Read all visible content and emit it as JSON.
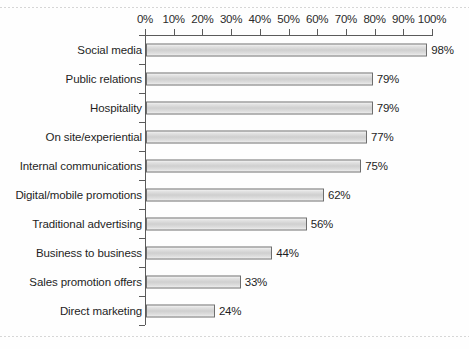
{
  "chart_data": {
    "type": "bar",
    "orientation": "horizontal",
    "title": "",
    "subtitle": "",
    "xlabel": "",
    "ylabel": "",
    "xlim": [
      0,
      100
    ],
    "grid": false,
    "legend": null,
    "tick_labels": [
      "0%",
      "10%",
      "20%",
      "30%",
      "40%",
      "50%",
      "60%",
      "70%",
      "80%",
      "90%",
      "100%"
    ],
    "tick_values": [
      0,
      10,
      20,
      30,
      40,
      50,
      60,
      70,
      80,
      90,
      100
    ],
    "categories": [
      "Social media",
      "Public relations",
      "Hospitality",
      "On site/experiential",
      "Internal communications",
      "Digital/mobile promotions",
      "Traditional advertising",
      "Business to business",
      "Sales promotion offers",
      "Direct marketing"
    ],
    "values": [
      98,
      79,
      79,
      77,
      75,
      62,
      56,
      44,
      33,
      24
    ],
    "data_labels": [
      "98%",
      "79%",
      "79%",
      "77%",
      "75%",
      "62%",
      "56%",
      "44%",
      "33%",
      "24%"
    ],
    "colors": {
      "bar_fill_light": "#f4f4f4",
      "bar_fill_mid": "#cfcfcf",
      "bar_border": "#6e6e6e",
      "axis": "#5a5a5a",
      "text": "#1f1f1f",
      "background": "#fefefe"
    }
  }
}
